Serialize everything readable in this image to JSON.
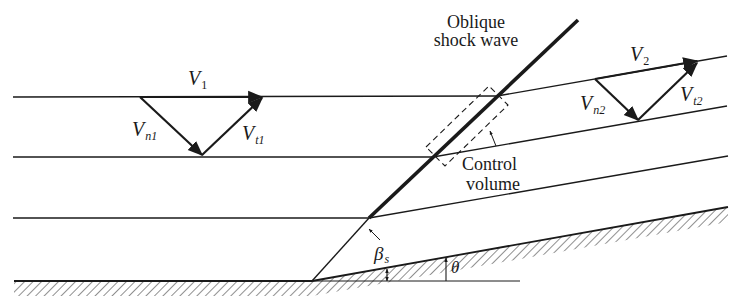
{
  "figure": {
    "colors": {
      "ink": "#1a1a1a",
      "background": "#ffffff"
    },
    "labels": {
      "shock_line1": "Oblique",
      "shock_line2": "shock wave",
      "cv_line1": "Control",
      "cv_line2": "volume",
      "v1": {
        "main": "V",
        "sub": "1"
      },
      "vn1": {
        "main": "V",
        "sub": "n1"
      },
      "vt1": {
        "main": "V",
        "sub": "t1"
      },
      "v2": {
        "main": "V",
        "sub": "2"
      },
      "vn2": {
        "main": "V",
        "sub": "n2"
      },
      "vt2": {
        "main": "V",
        "sub": "t2"
      },
      "beta": {
        "main": "β",
        "sub": "s"
      },
      "theta": "θ"
    }
  }
}
